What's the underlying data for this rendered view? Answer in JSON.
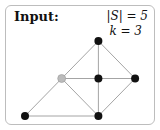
{
  "title": "Input:",
  "params": [
    "|S| = 5",
    "k = 3"
  ],
  "graph": {
    "nodes": [
      {
        "id": "top",
        "color": "#111111",
        "gx": 2,
        "gy": 0
      },
      {
        "id": "gray",
        "color": "#bbbbbb",
        "gx": 1,
        "gy": 1
      },
      {
        "id": "center",
        "color": "#111111",
        "gx": 2,
        "gy": 1
      },
      {
        "id": "right",
        "color": "#111111",
        "gx": 3,
        "gy": 1
      },
      {
        "id": "bottom-left",
        "color": "#111111",
        "gx": 0,
        "gy": 2
      },
      {
        "id": "bottom-mid",
        "color": "#111111",
        "gx": 2,
        "gy": 2
      }
    ],
    "edges": [
      [
        "top",
        "gray"
      ],
      [
        "top",
        "center"
      ],
      [
        "top",
        "right"
      ],
      [
        "gray",
        "center"
      ],
      [
        "center",
        "right"
      ],
      [
        "gray",
        "bottom-left"
      ],
      [
        "gray",
        "bottom-mid"
      ],
      [
        "center",
        "bottom-mid"
      ],
      [
        "right",
        "bottom-mid"
      ],
      [
        "bottom-left",
        "bottom-mid"
      ]
    ],
    "edge_color": "#9a9a9a"
  }
}
